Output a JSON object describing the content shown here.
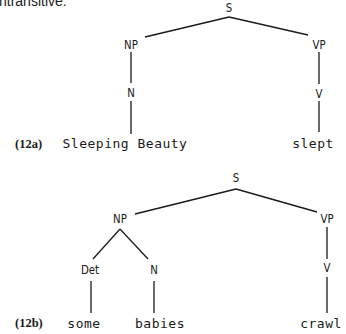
{
  "intro_text": "ntransitive:",
  "trees": [
    {
      "label": "(12a)",
      "nodes": {
        "S": "S",
        "NP": "NP",
        "VP": "VP",
        "N": "N",
        "V": "V"
      },
      "words": {
        "subject": "Sleeping Beauty",
        "verb": "slept"
      },
      "structure": "[S [NP [N Sleeping Beauty]] [VP [V slept]]]"
    },
    {
      "label": "(12b)",
      "nodes": {
        "S": "S",
        "NP": "NP",
        "VP": "VP",
        "Det": "Det",
        "N": "N",
        "V": "V"
      },
      "words": {
        "det": "some",
        "noun": "babies",
        "verb": "crawl"
      },
      "structure": "[S [NP [Det some] [N babies]] [VP [V crawl]]]"
    }
  ]
}
